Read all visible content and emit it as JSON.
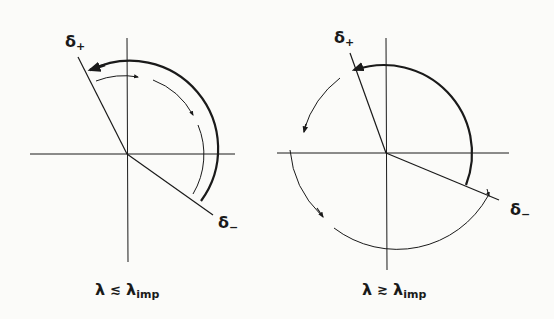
{
  "figure": {
    "panels": [
      {
        "id": "left",
        "labels": {
          "delta_plus": "δ",
          "delta_plus_sub": "+",
          "delta_minus": "δ",
          "delta_minus_sub": "−"
        },
        "caption": {
          "lhs": "λ",
          "relation": "≲",
          "rhs": "λ",
          "rhs_sub": "imp"
        }
      },
      {
        "id": "right",
        "labels": {
          "delta_plus": "δ",
          "delta_plus_sub": "+",
          "delta_minus": "δ",
          "delta_minus_sub": "−"
        },
        "caption": {
          "lhs": "λ",
          "relation": "≳",
          "rhs": "λ",
          "rhs_sub": "imp"
        }
      }
    ],
    "colors": {
      "ink": "#1a1a1a",
      "background": "#fbfbf9"
    }
  }
}
